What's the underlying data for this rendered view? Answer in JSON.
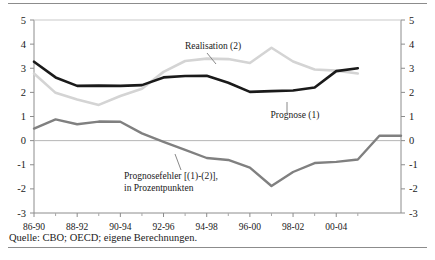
{
  "figure": {
    "source_note": "Quelle: CBO; OECD; eigene Berechnungen.",
    "annotations": {
      "realisation": "Realisation (2)",
      "prognose": "Prognose (1)",
      "fehler_line1": "Prognosefehler [(1)-(2)],",
      "fehler_line2": "in Prozentpunkten"
    }
  },
  "chart_data": {
    "type": "line",
    "title": "",
    "subtitle": "",
    "xlabel": "",
    "ylabel": "",
    "categories": [
      "86-90",
      "87-91",
      "88-92",
      "89-93",
      "90-94",
      "91-95",
      "92-96",
      "93-97",
      "94-98",
      "95-99",
      "96-00",
      "97-01",
      "98-02",
      "99-03",
      "00-04",
      "01-05"
    ],
    "xtick_labels": [
      "86-90",
      "88-92",
      "90-94",
      "92-96",
      "94-98",
      "96-00",
      "98-02",
      "00-04"
    ],
    "xtick_indices": [
      0,
      2,
      4,
      6,
      8,
      10,
      12,
      14
    ],
    "ylim": [
      -3,
      5
    ],
    "yticks": [
      5,
      4,
      3,
      2,
      1,
      0,
      -1,
      -2,
      -3
    ],
    "ytick_labels_left": [
      "5",
      "4",
      "3",
      "2",
      "1",
      "0",
      "-1",
      "-2",
      "-3"
    ],
    "ytick_labels_right": [
      "5",
      "4",
      "3",
      "2",
      "1",
      "0",
      "-1",
      "-2",
      "-3"
    ],
    "grid": false,
    "zero_line": true,
    "legend_position": "inline-annotations",
    "series": [
      {
        "name": "Prognose (1)",
        "color": "#1a1a1a",
        "width": 2.6,
        "values": [
          3.27,
          2.95,
          2.62,
          2.38,
          2.27,
          2.27,
          2.28,
          2.45,
          2.6,
          2.68,
          2.69,
          2.4,
          2.1,
          2.02,
          2.05,
          2.08
        ]
      },
      {
        "name": "Realisation (2)",
        "color": "#d4d4d4",
        "width": 2.6,
        "values": [
          2.78,
          2.28,
          1.97,
          1.72,
          1.48,
          1.7,
          1.95,
          2.15,
          2.62,
          2.85,
          3.1,
          3.28,
          3.33,
          3.3,
          3.25,
          3.4
        ]
      },
      {
        "name": "Prognosefehler [(1)-(2)], in Prozentpunkten",
        "color": "#808080",
        "width": 2.4,
        "values": [
          0.5,
          0.68,
          0.88,
          0.7,
          0.68,
          0.75,
          0.79,
          0.6,
          0.42,
          0.2,
          0.02,
          -0.18,
          -0.36,
          -0.52,
          -0.68,
          -0.74
        ]
      }
    ],
    "series_points": {
      "prognose": [
        [
          0,
          3.27
        ],
        [
          1,
          2.62
        ],
        [
          2,
          2.27
        ],
        [
          3,
          2.28
        ],
        [
          4,
          2.27
        ],
        [
          5,
          2.3
        ],
        [
          6,
          2.62
        ],
        [
          7,
          2.68
        ],
        [
          8,
          2.69
        ],
        [
          9,
          2.4
        ],
        [
          10,
          2.02
        ],
        [
          11,
          2.05
        ],
        [
          12,
          2.08
        ],
        [
          13,
          2.2
        ],
        [
          14,
          2.88
        ],
        [
          15,
          3.0
        ]
      ],
      "realisation": [
        [
          0,
          2.78
        ],
        [
          1,
          1.98
        ],
        [
          2,
          1.7
        ],
        [
          3,
          1.48
        ],
        [
          4,
          1.85
        ],
        [
          5,
          2.15
        ],
        [
          6,
          2.85
        ],
        [
          7,
          3.3
        ],
        [
          8,
          3.4
        ],
        [
          9,
          3.38
        ],
        [
          10,
          3.22
        ],
        [
          11,
          3.85
        ],
        [
          12,
          3.28
        ],
        [
          13,
          2.95
        ],
        [
          14,
          2.9
        ],
        [
          15,
          2.78
        ]
      ],
      "prognosefehler": [
        [
          0,
          0.5
        ],
        [
          1,
          0.88
        ],
        [
          2,
          0.68
        ],
        [
          3,
          0.79
        ],
        [
          4,
          0.78
        ],
        [
          5,
          0.3
        ],
        [
          6,
          -0.05
        ],
        [
          7,
          -0.38
        ],
        [
          8,
          -0.72
        ],
        [
          9,
          -0.8
        ],
        [
          10,
          -1.12
        ],
        [
          11,
          -1.88
        ],
        [
          12,
          -1.3
        ],
        [
          13,
          -0.93
        ],
        [
          14,
          -0.88
        ],
        [
          15,
          -0.78
        ],
        [
          16,
          0.2
        ],
        [
          17,
          0.2
        ]
      ]
    }
  }
}
